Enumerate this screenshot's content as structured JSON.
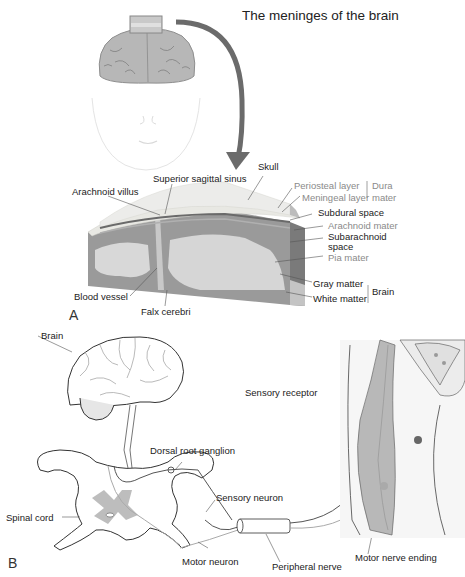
{
  "title": "The meninges of the brain",
  "panel_a": {
    "letter": "A",
    "labels": {
      "skull": "Skull",
      "superior_sagittal_sinus": "Superior sagittal sinus",
      "arachnoid_villus": "Arachnoid villus",
      "periosteal_layer": "Periosteal layer",
      "meningeal_layer": "Meningeal layer",
      "dura_mater_1": "Dura",
      "dura_mater_2": "mater",
      "subdural_space": "Subdural space",
      "arachnoid_mater": "Arachnoid mater",
      "subarachnoid_1": "Subarachnoid",
      "subarachnoid_2": "space",
      "pia_mater": "Pia mater",
      "gray_matter": "Gray matter",
      "white_matter": "White matter",
      "brain_group": "Brain",
      "blood_vessel": "Blood vessel",
      "falx_cerebri": "Falx cerebri"
    }
  },
  "panel_b": {
    "letter": "B",
    "labels": {
      "brain": "Brain",
      "dorsal_root_ganglion": "Dorsal root ganglion",
      "spinal_cord": "Spinal cord",
      "sensory_neuron": "Sensory neuron",
      "motor_neuron": "Motor neuron",
      "peripheral_nerve": "Peripheral nerve",
      "sensory_receptor": "Sensory receptor",
      "motor_nerve_ending": "Motor nerve ending"
    }
  },
  "colors": {
    "arrow": "#6b6b6b",
    "brain_fill": "#b9b9b9",
    "skull": "#e6e6e1",
    "dura": "#cfcfcf",
    "gray_matter": "#7d7d7d",
    "white_matter": "#d5d5d5",
    "muscle": "#bcbcbc",
    "label_gray": "#8a8a8a"
  }
}
